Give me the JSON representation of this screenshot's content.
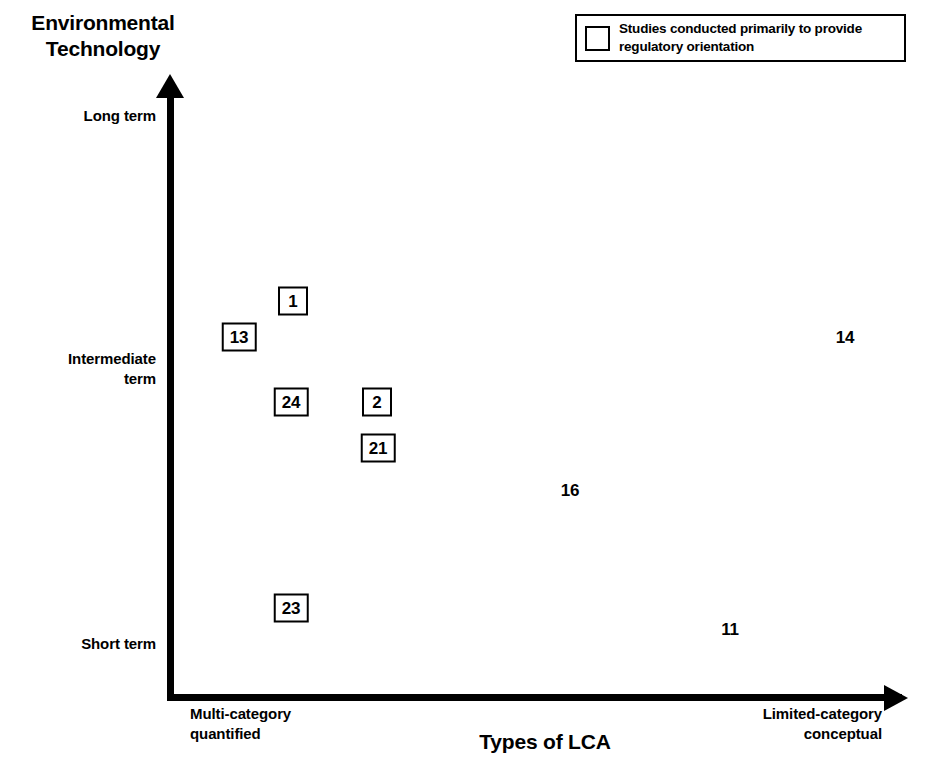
{
  "chart_data": {
    "type": "scatter",
    "title": "",
    "xlabel": "Types of LCA",
    "ylabel": "Environmental\nTechnology",
    "x_tick_labels": [
      "Multi-category\nquantified",
      "Limited-category\nconceptual"
    ],
    "y_tick_labels": [
      "Long term",
      "Intermediate\nterm",
      "Short term"
    ],
    "grid": false,
    "legend": {
      "position": "top-right",
      "entries": [
        {
          "marker": "open-square",
          "label": "Studies conducted primarily to provide\nregulatory orientation"
        }
      ]
    },
    "series": [
      {
        "name": "Studies conducted primarily to provide regulatory orientation",
        "marker": "boxed",
        "points": [
          {
            "label": "1",
            "x": 293,
            "y": 301
          },
          {
            "label": "13",
            "x": 239,
            "y": 337
          },
          {
            "label": "24",
            "x": 291,
            "y": 402
          },
          {
            "label": "2",
            "x": 377,
            "y": 402
          },
          {
            "label": "21",
            "x": 378,
            "y": 448
          },
          {
            "label": "23",
            "x": 291,
            "y": 608
          }
        ]
      },
      {
        "name": "Other studies",
        "marker": "plain",
        "points": [
          {
            "label": "14",
            "x": 845,
            "y": 338
          },
          {
            "label": "16",
            "x": 570,
            "y": 491
          },
          {
            "label": "11",
            "x": 730,
            "y": 630
          }
        ]
      }
    ]
  },
  "axes": {
    "y_title": "Environmental\nTechnology",
    "x_title": "Types of LCA",
    "y_ticks": {
      "long": "Long term",
      "intermediate": "Intermediate\nterm",
      "short": "Short term"
    },
    "x_ticks": {
      "left": "Multi-category\nquantified",
      "right": "Limited-category\nconceptual"
    }
  },
  "legend": {
    "text": "Studies conducted primarily to provide\nregulatory orientation"
  },
  "colors": {
    "ink": "#000000",
    "background": "#ffffff"
  }
}
